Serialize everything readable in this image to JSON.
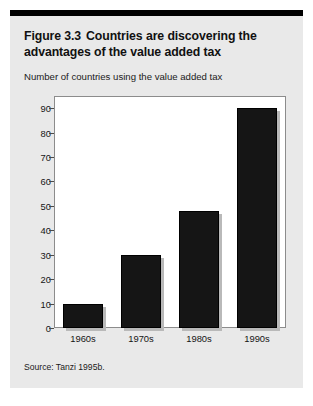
{
  "figure": {
    "number": "Figure 3.3",
    "title": "Countries are discovering the advantages of the value added tax",
    "subtitle": "Number of countries using the value added tax",
    "source": "Source: Tanzi 1995b."
  },
  "colors": {
    "card_background": "#e9e9e9",
    "plot_background": "#ffffff",
    "bar_fill": "#151515",
    "bar_shadow": "#b9b9b9",
    "rule": "#000000",
    "axis": "#8c8c8c",
    "text": "#151515"
  },
  "chart_data": {
    "type": "bar",
    "title": "Countries are discovering the advantages of the value added tax",
    "subtitle": "Number of countries using the value added tax",
    "categories": [
      "1960s",
      "1970s",
      "1980s",
      "1990s"
    ],
    "values": [
      10,
      30,
      48,
      90
    ],
    "series": [
      {
        "name": "Number of countries using the value added tax",
        "values": [
          10,
          30,
          48,
          90
        ]
      }
    ],
    "xlabel": "",
    "ylabel": "Number of countries using the value added tax",
    "ylim": [
      0,
      95
    ],
    "yticks": [
      0,
      10,
      20,
      30,
      40,
      50,
      60,
      70,
      80,
      90
    ],
    "ytick_labels": [
      "0",
      "10",
      "20",
      "30",
      "40",
      "50",
      "60",
      "70",
      "80",
      "90"
    ],
    "grid": false,
    "legend": false,
    "source": "Source: Tanzi 1995b."
  }
}
